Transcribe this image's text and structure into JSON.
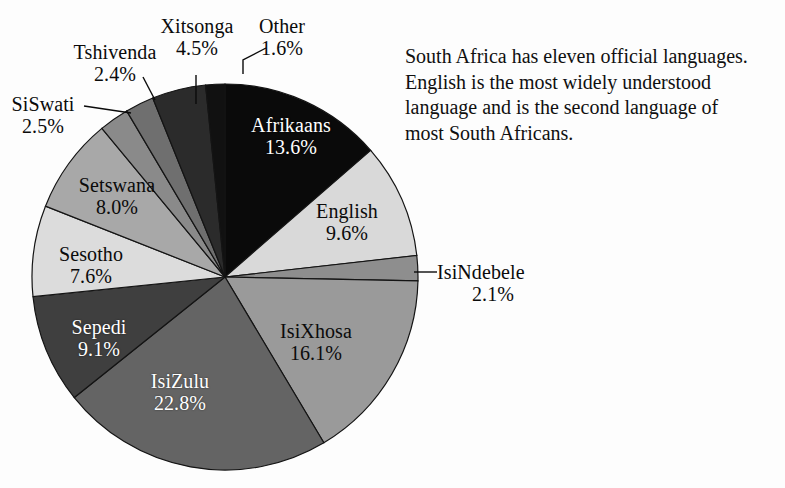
{
  "figure": {
    "background_color": "#fdfdfd",
    "note_lines": [
      "South Africa has eleven official languages.",
      "English is the most widely understood",
      "language and is the second language of",
      "most South Africans."
    ]
  },
  "chart_data": {
    "type": "pie",
    "title": "",
    "xlabel": "",
    "ylabel": "",
    "units": "percent",
    "start_angle_deg": 0,
    "direction": "clockwise",
    "center": [
      225,
      277
    ],
    "radius": 193,
    "legend_position": "none",
    "grid": false,
    "total": 99.9,
    "categories": [
      "Afrikaans",
      "English",
      "IsiNdebele",
      "IsiXhosa",
      "IsiZulu",
      "Sepedi",
      "Sesotho",
      "Setswana",
      "SiSwati",
      "Tshivenda",
      "Xitsonga",
      "Other"
    ],
    "values": [
      13.6,
      9.6,
      2.1,
      16.1,
      22.8,
      9.1,
      7.6,
      8.0,
      2.5,
      2.4,
      4.5,
      1.6
    ],
    "value_labels": [
      "13.6%",
      "9.6%",
      "2.1%",
      "16.1%",
      "22.8%",
      "9.1%",
      "7.6%",
      "8.0%",
      "2.5%",
      "2.4%",
      "4.5%",
      "1.6%"
    ],
    "colors": [
      "#0a0a0a",
      "#d9d9d9",
      "#8e8e8e",
      "#9a9a9a",
      "#646464",
      "#3f3f3f",
      "#dcdcdc",
      "#a8a8a8",
      "#8a8a8a",
      "#6f6f6f",
      "#2b2b2b",
      "#111111"
    ],
    "slices": [
      {
        "name": "Afrikaans",
        "value": 13.6,
        "label": "Afrikaans",
        "value_label": "13.6%",
        "color": "#0a0a0a",
        "label_placement": "inside-dark"
      },
      {
        "name": "English",
        "value": 9.6,
        "label": "English",
        "value_label": "9.6%",
        "color": "#d9d9d9",
        "label_placement": "inside-light"
      },
      {
        "name": "IsiNdebele",
        "value": 2.1,
        "label": "IsiNdebele",
        "value_label": "2.1%",
        "color": "#8e8e8e",
        "label_placement": "outside"
      },
      {
        "name": "IsiXhosa",
        "value": 16.1,
        "label": "IsiXhosa",
        "value_label": "16.1%",
        "color": "#9a9a9a",
        "label_placement": "inside-light"
      },
      {
        "name": "IsiZulu",
        "value": 22.8,
        "label": "IsiZulu",
        "value_label": "22.8%",
        "color": "#646464",
        "label_placement": "inside-dark"
      },
      {
        "name": "Sepedi",
        "value": 9.1,
        "label": "Sepedi",
        "value_label": "9.1%",
        "color": "#3f3f3f",
        "label_placement": "inside-dark"
      },
      {
        "name": "Sesotho",
        "value": 7.6,
        "label": "Sesotho",
        "value_label": "7.6%",
        "color": "#dcdcdc",
        "label_placement": "inside-light"
      },
      {
        "name": "Setswana",
        "value": 8.0,
        "label": "Setswana",
        "value_label": "8.0%",
        "color": "#a8a8a8",
        "label_placement": "inside-light"
      },
      {
        "name": "SiSwati",
        "value": 2.5,
        "label": "SiSwati",
        "value_label": "2.5%",
        "color": "#8a8a8a",
        "label_placement": "outside"
      },
      {
        "name": "Tshivenda",
        "value": 2.4,
        "label": "Tshivenda",
        "value_label": "2.4%",
        "color": "#6f6f6f",
        "label_placement": "outside"
      },
      {
        "name": "Xitsonga",
        "value": 4.5,
        "label": "Xitsonga",
        "value_label": "4.5%",
        "color": "#2b2b2b",
        "label_placement": "outside"
      },
      {
        "name": "Other",
        "value": 1.6,
        "label": "Other",
        "value_label": "1.6%",
        "color": "#111111",
        "label_placement": "outside"
      }
    ]
  }
}
